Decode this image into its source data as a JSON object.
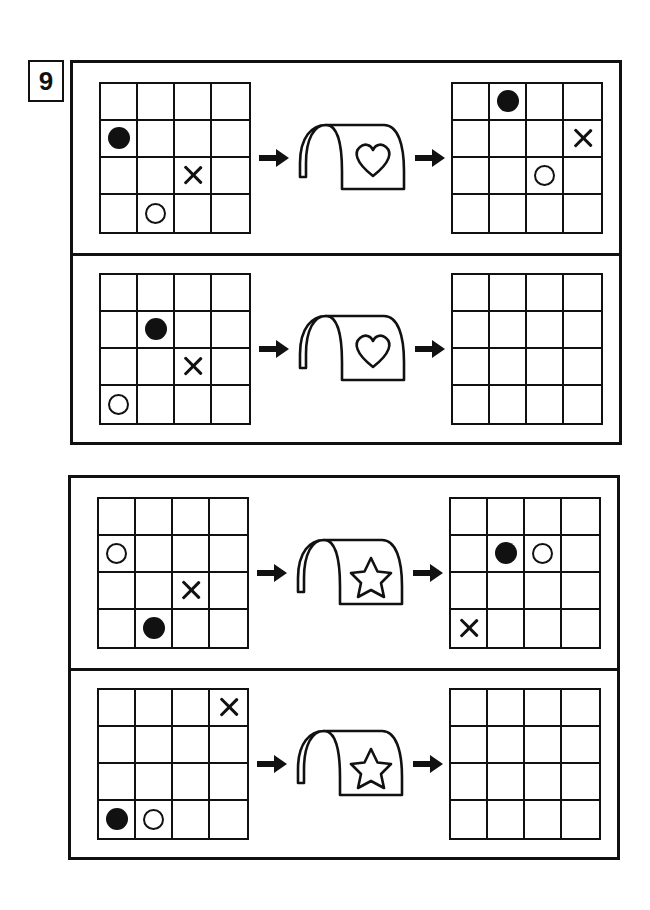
{
  "problem": {
    "number": "9",
    "type": "grid-transformation-puzzle"
  },
  "tokens": {
    "filled_circle": "filled-circle",
    "open_circle": "open-circle",
    "cross": "cross",
    "empty": ""
  },
  "colors": {
    "ink": "#111111",
    "paper": "#ffffff"
  },
  "machines": {
    "heart": {
      "symbol_name": "heart-icon",
      "label": "heart"
    },
    "star": {
      "symbol_name": "star-icon",
      "label": "star"
    }
  },
  "arrows": {
    "in_name": "arrow-right-into-machine",
    "out_name": "arrow-right-out-of-machine"
  },
  "groups": [
    {
      "id": "group-1",
      "machine": "heart",
      "rows": [
        {
          "id": "row-1",
          "solved": true,
          "input": {
            "rows": 4,
            "cols": 4,
            "cells": [
              [
                "",
                "",
                "",
                ""
              ],
              [
                "filled-circle",
                "",
                "",
                ""
              ],
              [
                "",
                "",
                "cross",
                ""
              ],
              [
                "",
                "open-circle",
                "",
                ""
              ]
            ]
          },
          "output": {
            "rows": 4,
            "cols": 4,
            "cells": [
              [
                "",
                "filled-circle",
                "",
                ""
              ],
              [
                "",
                "",
                "",
                "cross"
              ],
              [
                "",
                "",
                "open-circle",
                ""
              ],
              [
                "",
                "",
                "",
                ""
              ]
            ]
          }
        },
        {
          "id": "row-2",
          "solved": false,
          "input": {
            "rows": 4,
            "cols": 4,
            "cells": [
              [
                "",
                "",
                "",
                ""
              ],
              [
                "",
                "filled-circle",
                "",
                ""
              ],
              [
                "",
                "",
                "cross",
                ""
              ],
              [
                "open-circle",
                "",
                "",
                ""
              ]
            ]
          },
          "output": {
            "rows": 4,
            "cols": 4,
            "cells": [
              [
                "",
                "",
                "",
                ""
              ],
              [
                "",
                "",
                "",
                ""
              ],
              [
                "",
                "",
                "",
                ""
              ],
              [
                "",
                "",
                "",
                ""
              ]
            ]
          }
        }
      ]
    },
    {
      "id": "group-2",
      "machine": "star",
      "rows": [
        {
          "id": "row-3",
          "solved": true,
          "input": {
            "rows": 4,
            "cols": 4,
            "cells": [
              [
                "",
                "",
                "",
                ""
              ],
              [
                "open-circle",
                "",
                "",
                ""
              ],
              [
                "",
                "",
                "cross",
                ""
              ],
              [
                "",
                "filled-circle",
                "",
                ""
              ]
            ]
          },
          "output": {
            "rows": 4,
            "cols": 4,
            "cells": [
              [
                "",
                "",
                "",
                ""
              ],
              [
                "",
                "filled-circle",
                "open-circle",
                ""
              ],
              [
                "",
                "",
                "",
                ""
              ],
              [
                "cross",
                "",
                "",
                ""
              ]
            ]
          }
        },
        {
          "id": "row-4",
          "solved": false,
          "input": {
            "rows": 4,
            "cols": 4,
            "cells": [
              [
                "",
                "",
                "",
                "cross"
              ],
              [
                "",
                "",
                "",
                ""
              ],
              [
                "",
                "",
                "",
                ""
              ],
              [
                "filled-circle",
                "open-circle",
                "",
                ""
              ]
            ]
          },
          "output": {
            "rows": 4,
            "cols": 4,
            "cells": [
              [
                "",
                "",
                "",
                ""
              ],
              [
                "",
                "",
                "",
                ""
              ],
              [
                "",
                "",
                "",
                ""
              ],
              [
                "",
                "",
                "",
                ""
              ]
            ]
          }
        }
      ]
    }
  ]
}
